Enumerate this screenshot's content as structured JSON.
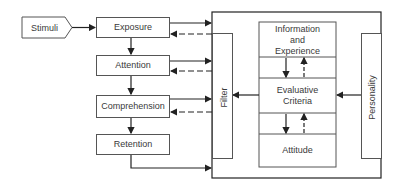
{
  "diagram": {
    "input": {
      "label": "Stimuli"
    },
    "stages": [
      {
        "label": "Exposure"
      },
      {
        "label": "Attention"
      },
      {
        "label": "Comprehension"
      },
      {
        "label": "Retention"
      }
    ],
    "filter": {
      "label": "Filter"
    },
    "personality": {
      "label": "Personality"
    },
    "memory_column": [
      {
        "label": "Information and Experience",
        "lines": [
          "Information",
          "and",
          "Experience"
        ]
      },
      {
        "label": "Evaluative Criteria",
        "lines": [
          "Evaluative",
          "Criteria"
        ]
      },
      {
        "label": "Attitude",
        "lines": [
          "Attitude"
        ]
      }
    ],
    "colors": {
      "line": "#222222",
      "box_border": "#555555",
      "text": "#3a3a3a"
    }
  }
}
